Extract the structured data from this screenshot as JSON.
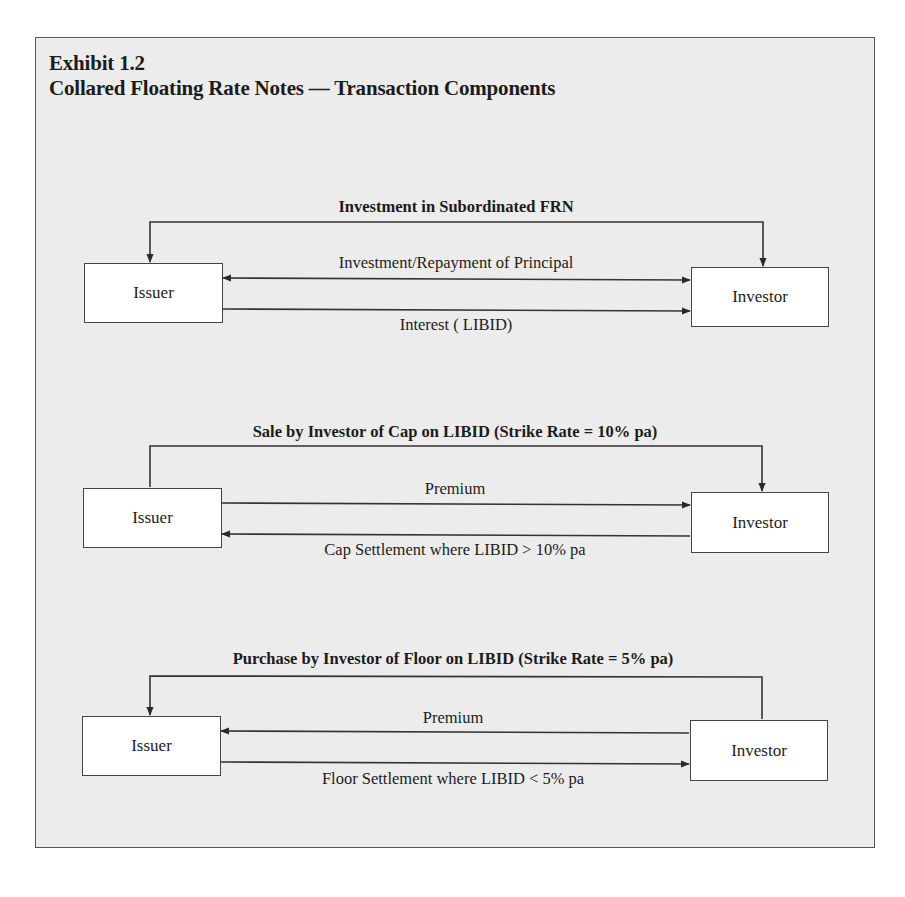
{
  "exhibit": {
    "number": "Exhibit 1.2",
    "title": "Collared Floating Rate Notes — Transaction Components"
  },
  "sections": [
    {
      "title": "Investment in Subordinated FRN",
      "left_party": "Issuer",
      "right_party": "Investor",
      "flows": [
        {
          "label": "Investment/Repayment of Principal",
          "direction": "bidirectional"
        },
        {
          "label": "Interest ( LIBID)",
          "direction": "issuer-to-investor"
        }
      ]
    },
    {
      "title": "Sale by Investor of Cap on LIBID (Strike Rate = 10% pa)",
      "left_party": "Issuer",
      "right_party": "Investor",
      "flows": [
        {
          "label": "Premium",
          "direction": "issuer-to-investor"
        },
        {
          "label": "Cap Settlement where LIBID > 10% pa",
          "direction": "investor-to-issuer"
        }
      ]
    },
    {
      "title": "Purchase by Investor of Floor on LIBID (Strike Rate = 5% pa)",
      "left_party": "Issuer",
      "right_party": "Investor",
      "flows": [
        {
          "label": "Premium",
          "direction": "investor-to-issuer"
        },
        {
          "label": "Floor Settlement where LIBID < 5% pa",
          "direction": "issuer-to-investor"
        }
      ]
    }
  ],
  "colors": {
    "panel_background": "#ececec",
    "box_fill": "#ffffff",
    "line": "#333333"
  }
}
